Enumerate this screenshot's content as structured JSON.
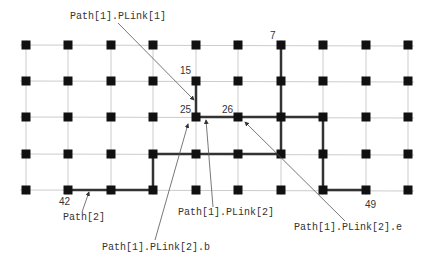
{
  "diagram": {
    "grid": {
      "rows": 5,
      "cols": 10
    },
    "colors": {
      "grid_line": "#cccccc",
      "node": "#111111",
      "path": "#333333",
      "leader": "#555555"
    },
    "node_labels": [
      {
        "id": "node-7",
        "text": "7",
        "node": 7
      },
      {
        "id": "node-15",
        "text": "15",
        "node": 15
      },
      {
        "id": "node-25",
        "text": "25",
        "node": 25
      },
      {
        "id": "node-26",
        "text": "26",
        "node": 26
      },
      {
        "id": "node-42",
        "text": "42",
        "node": 42
      },
      {
        "id": "node-49",
        "text": "49",
        "node": 49
      }
    ],
    "paths": [
      {
        "name": "Path[1]",
        "segments": [
          [
            7,
            37
          ],
          [
            15,
            25
          ],
          [
            25,
            28
          ],
          [
            28,
            48
          ],
          [
            48,
            49
          ]
        ]
      },
      {
        "name": "Path[2]",
        "segments": [
          [
            42,
            44
          ],
          [
            44,
            34
          ],
          [
            34,
            37
          ]
        ]
      }
    ],
    "annotations": [
      {
        "id": "path1-plink1",
        "text": "Path[1].PLink[1]"
      },
      {
        "id": "path1-plink2",
        "text": "Path[1].PLink[2]"
      },
      {
        "id": "path1-plink2-b",
        "text": "Path[1].PLink[2].b"
      },
      {
        "id": "path1-plink2-e",
        "text": "Path[1].PLink[2].e"
      },
      {
        "id": "path2",
        "text": "Path[2]"
      }
    ]
  }
}
